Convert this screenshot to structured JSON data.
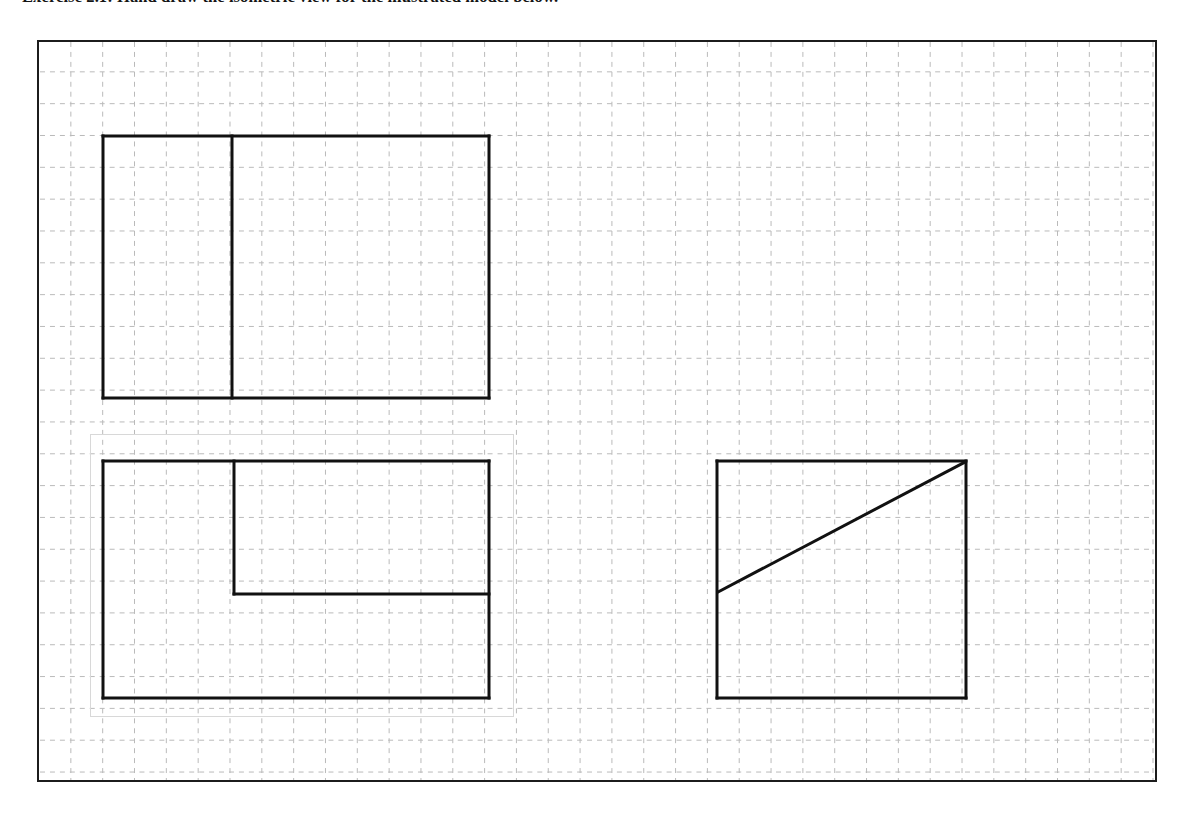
{
  "document": {
    "heading": "Exercise 2.1: Hand draw the isometric view for the illustrated model below.",
    "heading_prefix": "Exercise 2.1:",
    "heading_body": "Hand draw the isometric view for the illustrated model below."
  },
  "drawing": {
    "title": "Orthographic multiview drawing on dashed grid paper",
    "frame": {
      "x": 37,
      "y": 40,
      "width": 1120,
      "height": 742,
      "border_color": "#1c1c1c",
      "border_width": 2,
      "background": "#ffffff"
    },
    "grid": {
      "pitch": 32,
      "color": "#b9b9b9",
      "style": "dashed",
      "dash": "5 5",
      "stroke_width": 1,
      "origin_x": 31,
      "origin_y": 30
    },
    "line_color": "#111111",
    "line_width": 3,
    "ghost_artifact": {
      "label": "faint scan artifact rectangle",
      "x": 51,
      "y": 392,
      "width": 424,
      "height": 283,
      "color": "#d8d8d8"
    },
    "views": [
      {
        "name": "front-view",
        "label": "Front view",
        "description": "Rectangle divided by one vertical line near the left third",
        "x": 64,
        "y": 94,
        "width": 386,
        "height": 262,
        "segments": [
          {
            "name": "outline-top",
            "x1": 0,
            "y1": 0,
            "x2": 386,
            "y2": 0
          },
          {
            "name": "outline-right",
            "x1": 386,
            "y1": 0,
            "x2": 386,
            "y2": 262
          },
          {
            "name": "outline-bottom",
            "x1": 386,
            "y1": 262,
            "x2": 0,
            "y2": 262
          },
          {
            "name": "outline-left",
            "x1": 0,
            "y1": 262,
            "x2": 0,
            "y2": 0
          },
          {
            "name": "vertical-divider",
            "x1": 129,
            "y1": 0,
            "x2": 129,
            "y2": 262
          }
        ]
      },
      {
        "name": "top-view",
        "label": "Top view",
        "description": "Rectangle with an inner step: vertical line down to a horizontal ledge",
        "x": 64,
        "y": 419,
        "width": 386,
        "height": 237,
        "segments": [
          {
            "name": "outline-top",
            "x1": 0,
            "y1": 0,
            "x2": 386,
            "y2": 0
          },
          {
            "name": "outline-right",
            "x1": 386,
            "y1": 0,
            "x2": 386,
            "y2": 237
          },
          {
            "name": "outline-bottom",
            "x1": 386,
            "y1": 237,
            "x2": 0,
            "y2": 237
          },
          {
            "name": "outline-left",
            "x1": 0,
            "y1": 237,
            "x2": 0,
            "y2": 0
          },
          {
            "name": "step-vertical",
            "x1": 131,
            "y1": 0,
            "x2": 131,
            "y2": 133
          },
          {
            "name": "step-horizontal",
            "x1": 131,
            "y1": 133,
            "x2": 386,
            "y2": 133
          }
        ]
      },
      {
        "name": "side-view",
        "label": "Side view",
        "description": "Square with a diagonal from mid-left edge to the top-right corner",
        "x": 678,
        "y": 419,
        "width": 249,
        "height": 237,
        "segments": [
          {
            "name": "outline-top",
            "x1": 0,
            "y1": 0,
            "x2": 249,
            "y2": 0
          },
          {
            "name": "outline-right",
            "x1": 249,
            "y1": 0,
            "x2": 249,
            "y2": 237
          },
          {
            "name": "outline-bottom",
            "x1": 249,
            "y1": 237,
            "x2": 0,
            "y2": 237
          },
          {
            "name": "outline-left",
            "x1": 0,
            "y1": 237,
            "x2": 0,
            "y2": 0
          },
          {
            "name": "diagonal",
            "x1": 1,
            "y1": 131,
            "x2": 248,
            "y2": 1
          }
        ]
      }
    ]
  }
}
